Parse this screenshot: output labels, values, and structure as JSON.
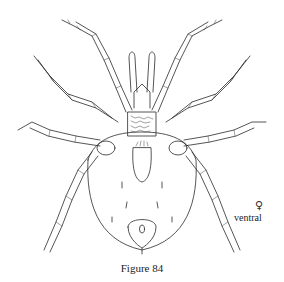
{
  "figure": {
    "caption": "Figure 84",
    "sex_symbol": "♀",
    "view_label": "ventral",
    "ink_color": "#2a2a2a",
    "background_color": "#ffffff"
  }
}
